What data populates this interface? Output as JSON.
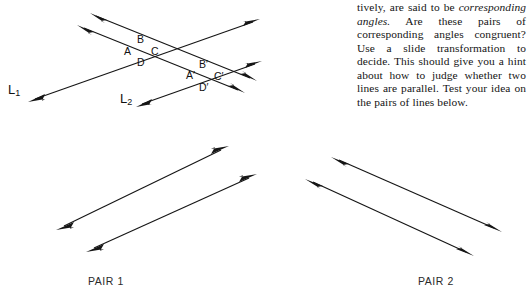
{
  "page": {
    "background_color": "#ffffff",
    "ink_color": "#151515",
    "width": 528,
    "height": 297
  },
  "body_text": {
    "segments": [
      {
        "text": "tively, are said to be ",
        "style": "roman"
      },
      {
        "text": "corresponding angles.",
        "style": "italic"
      },
      {
        "text": " Are these pairs of corresponding angles congruent? Use a slide transformation to decide. This should give you a hint about how to judge whether two lines are parallel. Test your idea on the pairs of lines below.",
        "style": "roman"
      }
    ],
    "plain": "tively, are said to be corresponding angles. Are these pairs of corresponding angles congruent? Use a slide transformation to decide. This should give you a hint about how to judge whether two lines are parallel. Test your idea on the pairs of lines below."
  },
  "top_figure": {
    "name": "two-transversals-figure",
    "line_labels": [
      {
        "key": "L1",
        "base": "L",
        "sub": "1",
        "x": 8,
        "y": 83
      },
      {
        "key": "L2",
        "base": "L",
        "sub": "2",
        "x": 120,
        "y": 92
      }
    ],
    "angle_labels": [
      {
        "text": "A",
        "x": 124,
        "y": 46
      },
      {
        "text": "B",
        "x": 137,
        "y": 34
      },
      {
        "text": "C",
        "x": 151,
        "y": 46
      },
      {
        "text": "D",
        "x": 137,
        "y": 57
      },
      {
        "text": "A′",
        "x": 186,
        "y": 70
      },
      {
        "text": "B′",
        "x": 199,
        "y": 59
      },
      {
        "text": "C′",
        "x": 214,
        "y": 71
      },
      {
        "text": "D′",
        "x": 199,
        "y": 82
      }
    ]
  },
  "pair1": {
    "caption": "PAIR 1",
    "caption_x": 88,
    "caption_y": 276
  },
  "pair2": {
    "caption": "PAIR 2",
    "caption_x": 418,
    "caption_y": 276
  }
}
